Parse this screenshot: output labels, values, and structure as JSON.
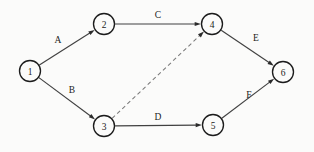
{
  "figure": {
    "kind": "directed-graph-diagram",
    "background_color": "#fbfbfa",
    "line_color": "#414141",
    "dashed_line_color": "#7a7a7a",
    "node_stroke_color": "#1c1c1c",
    "text_color": "#1b1b1b"
  },
  "nodes": [
    {
      "id": "n1",
      "label": "1",
      "cx": 30,
      "cy": 71,
      "r": 10.5
    },
    {
      "id": "n2",
      "label": "2",
      "cx": 104,
      "cy": 24,
      "r": 10.5
    },
    {
      "id": "n3",
      "label": "3",
      "cx": 104,
      "cy": 126,
      "r": 10.5
    },
    {
      "id": "n4",
      "label": "4",
      "cx": 212,
      "cy": 24,
      "r": 10.5
    },
    {
      "id": "n5",
      "label": "5",
      "cx": 213,
      "cy": 125,
      "r": 10.5
    },
    {
      "id": "n6",
      "label": "6",
      "cx": 283,
      "cy": 72,
      "r": 10.5
    }
  ],
  "edges": [
    {
      "id": "eA",
      "label": "A",
      "from": "n1",
      "to": "n2",
      "style": "solid",
      "arrow": true,
      "label_x": 58,
      "label_y": 40
    },
    {
      "id": "eB",
      "label": "B",
      "from": "n1",
      "to": "n3",
      "style": "solid",
      "arrow": true,
      "label_x": 72,
      "label_y": 90
    },
    {
      "id": "eC",
      "label": "C",
      "from": "n2",
      "to": "n4",
      "style": "solid",
      "arrow": true,
      "label_x": 158,
      "label_y": 15
    },
    {
      "id": "eD",
      "label": "D",
      "from": "n3",
      "to": "n5",
      "style": "solid",
      "arrow": true,
      "label_x": 158,
      "label_y": 117
    },
    {
      "id": "eE",
      "label": "E",
      "from": "n4",
      "to": "n6",
      "style": "solid",
      "arrow": true,
      "label_x": 256,
      "label_y": 38
    },
    {
      "id": "eF",
      "label": "F",
      "from": "n5",
      "to": "n6",
      "style": "solid",
      "arrow": true,
      "label_x": 249,
      "label_y": 95
    },
    {
      "id": "eDash",
      "label": "",
      "from": "n3",
      "to": "n4",
      "style": "dashed",
      "arrow": true,
      "label_x": 0,
      "label_y": 0
    }
  ]
}
